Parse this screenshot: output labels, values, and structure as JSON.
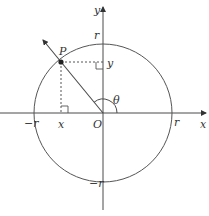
{
  "diagram": {
    "type": "unit-circle-angle",
    "colors": {
      "stroke": "#4a4a4a",
      "text": "#333333",
      "background": "#ffffff"
    },
    "labels": {
      "x_axis": "x",
      "y_axis": "y",
      "origin": "O",
      "point": "P",
      "angle": "θ",
      "r_right": "r",
      "r_top": "r",
      "r_left": "−r",
      "r_bottom": "−r",
      "x_coord": "x",
      "y_coord": "y"
    }
  }
}
